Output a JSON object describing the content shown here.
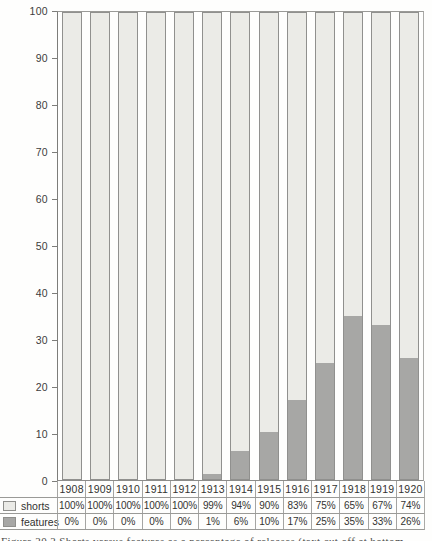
{
  "chart_data": {
    "type": "bar",
    "subtype": "stacked-percentage-columns",
    "title": "",
    "xlabel": "",
    "ylabel": "",
    "ylim": [
      0,
      100
    ],
    "yticks": [
      100,
      90,
      80,
      70,
      60,
      50,
      40,
      30,
      20,
      10,
      0
    ],
    "grid": false,
    "legend_position": "bottom-left table",
    "categories": [
      "1908",
      "1909",
      "1910",
      "1911",
      "1912",
      "1913",
      "1914",
      "1915",
      "1916",
      "1917",
      "1918",
      "1919",
      "1920"
    ],
    "series": [
      {
        "name": "shorts",
        "color": "#ebebe7",
        "values": [
          100,
          100,
          100,
          100,
          100,
          99,
          94,
          90,
          83,
          75,
          65,
          67,
          74
        ]
      },
      {
        "name": "features",
        "color": "#a7a7a5",
        "values": [
          0,
          0,
          0,
          0,
          0,
          1,
          6,
          10,
          17,
          25,
          35,
          33,
          26
        ]
      }
    ]
  },
  "table": {
    "years": [
      "1908",
      "1909",
      "1910",
      "1911",
      "1912",
      "1913",
      "1914",
      "1915",
      "1916",
      "1917",
      "1918",
      "1919",
      "1920"
    ],
    "shorts_values": [
      "100%",
      "100%",
      "100%",
      "100%",
      "100%",
      "99%",
      "94%",
      "90%",
      "83%",
      "75%",
      "65%",
      "67%",
      "74%"
    ],
    "features_values": [
      "0%",
      "0%",
      "0%",
      "0%",
      "0%",
      "1%",
      "6%",
      "10%",
      "17%",
      "25%",
      "35%",
      "33%",
      "26%"
    ]
  },
  "legend": {
    "shorts_label": "shorts",
    "features_label": "features"
  },
  "colors": {
    "shorts_fill": "#ebebe7",
    "features_fill": "#a7a7a5",
    "bar_border": "#90908e",
    "line": "#9a9a97",
    "text": "#383838"
  },
  "caption": {
    "text": "Figure 20.2 Shorts versus features as a percentage of releases (text cut off at bottom edge)"
  }
}
